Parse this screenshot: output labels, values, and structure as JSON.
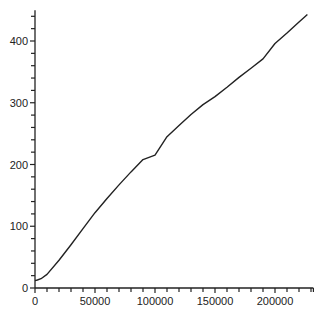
{
  "chart_data": {
    "type": "line",
    "title": "",
    "xlabel": "",
    "ylabel": "",
    "xlim": [
      0,
      232000
    ],
    "ylim": [
      0,
      450
    ],
    "grid": false,
    "legend": null,
    "x_ticks": [
      0,
      50000,
      100000,
      150000,
      200000
    ],
    "x_tick_labels": [
      "0",
      "50000",
      "100000",
      "150000",
      "200000"
    ],
    "x_minor_step": 10000,
    "y_ticks": [
      0,
      100,
      200,
      300,
      400
    ],
    "y_tick_labels": [
      "0",
      "100",
      "200",
      "300",
      "400"
    ],
    "y_minor_step": 20,
    "series": [
      {
        "name": "series-1",
        "color": "#222222",
        "x": [
          0,
          2000,
          5000,
          10000,
          20000,
          30000,
          40000,
          50000,
          60000,
          70000,
          80000,
          90000,
          100000,
          110000,
          120000,
          130000,
          140000,
          150000,
          160000,
          170000,
          180000,
          190000,
          200000,
          210000,
          220000,
          227000
        ],
        "y": [
          12,
          13,
          15,
          22,
          45,
          70,
          96,
          122,
          145,
          167,
          188,
          208,
          215,
          245,
          263,
          281,
          297,
          310,
          325,
          341,
          356,
          371,
          396,
          413,
          431,
          443
        ]
      }
    ]
  },
  "colors": {
    "axis": "#222222",
    "line": "#222222",
    "background": "#ffffff"
  }
}
